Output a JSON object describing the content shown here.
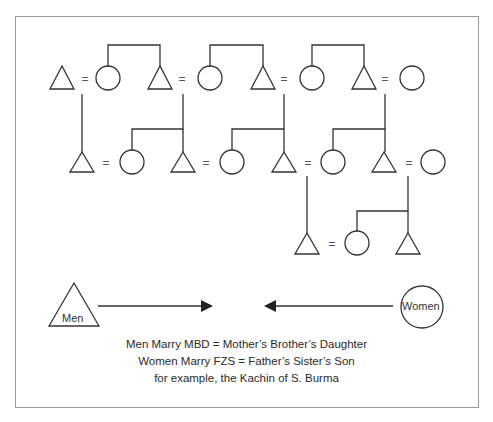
{
  "diagram": {
    "type": "kinship-diagram",
    "symbols": {
      "male": "triangle",
      "female": "circle",
      "marriage": "="
    },
    "legend": {
      "men_label": "Men",
      "women_label": "Women"
    },
    "caption": [
      "Men Marry MBD = Mother’s Brother’s Daughter",
      "Women Marry FZS = Father’s Sister’s Son",
      "for example, the Kachin of S. Burma"
    ],
    "colors": {
      "line": "#333333",
      "border": "#9a9a9a"
    }
  }
}
